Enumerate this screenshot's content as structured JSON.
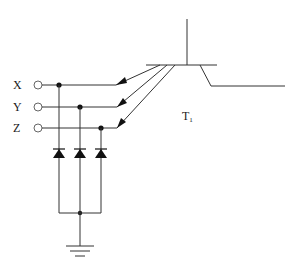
{
  "diagram": {
    "type": "circuit-schematic",
    "inputs": [
      {
        "label": "X",
        "y": 85,
        "junction_x": 59
      },
      {
        "label": "Y",
        "y": 107,
        "junction_x": 80
      },
      {
        "label": "Z",
        "y": 128,
        "junction_x": 101
      }
    ],
    "transistor": {
      "label_main": "T",
      "label_sub": "1",
      "emitter_count": 3
    },
    "diodes": {
      "count": 3,
      "orientation": "anode-at-ground-cathode-to-input"
    },
    "ground": {
      "symbol": "ground"
    },
    "colors": {
      "line": "#333333",
      "background": "#ffffff"
    }
  }
}
